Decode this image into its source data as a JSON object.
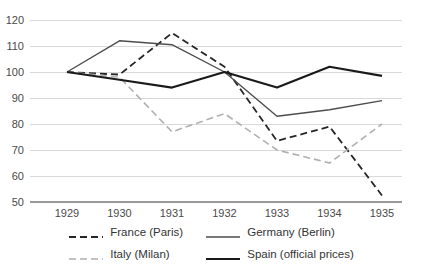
{
  "chart_data": {
    "type": "line",
    "title": "",
    "subtitle": "",
    "xlabel": "",
    "ylabel": "",
    "categories": [
      "1929",
      "1930",
      "1931",
      "1932",
      "1933",
      "1934",
      "1935"
    ],
    "x": [
      1929,
      1930,
      1931,
      1932,
      1933,
      1934,
      1935
    ],
    "xlim": [
      1929,
      1935
    ],
    "ylim": [
      50,
      120
    ],
    "y_ticks": [
      50,
      60,
      70,
      80,
      90,
      100,
      110,
      120
    ],
    "x_ticks": [
      "1929",
      "1930",
      "1931",
      "1932",
      "1933",
      "1934",
      "1935"
    ],
    "grid": true,
    "grid_axis": "y",
    "legend_position": "bottom",
    "legend_columns": 2,
    "series": [
      {
        "name": "France (Paris)",
        "values": [
          100,
          99,
          115,
          102,
          73.5,
          79,
          52.5
        ],
        "color": "#262626",
        "style": "dashed",
        "linewidth": 1.8,
        "dash": "7,4"
      },
      {
        "name": "Germany (Berlin)",
        "values": [
          100,
          112,
          110.5,
          100,
          83,
          85.5,
          89
        ],
        "color": "#4d4d4d",
        "style": "solid",
        "linewidth": 1.4,
        "dash": ""
      },
      {
        "name": "Italy (Milan)",
        "values": [
          100,
          98,
          77,
          84,
          70,
          65,
          80
        ],
        "color": "#b0b0b0",
        "style": "dashed",
        "linewidth": 1.6,
        "dash": "7,4"
      },
      {
        "name": "Spain (official prices)",
        "values": [
          100,
          97,
          94,
          100,
          94,
          102,
          98.5
        ],
        "color": "#1a1a1a",
        "style": "solid",
        "linewidth": 2.1,
        "dash": ""
      }
    ]
  },
  "legend": {
    "entries": [
      {
        "label": "France (Paris)"
      },
      {
        "label": "Germany (Berlin)"
      },
      {
        "label": "Italy (Milan)"
      },
      {
        "label": "Spain (official prices)"
      }
    ]
  },
  "colors": {
    "background": "#ffffff",
    "gridline": "#d9d9d9",
    "axis": "#9a9a9a",
    "tick_text": "#4a4a4a"
  }
}
